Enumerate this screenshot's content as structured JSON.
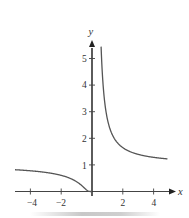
{
  "chart_data": {
    "type": "line",
    "title": "",
    "function": "y = e^(1/x)",
    "xlabel": "x",
    "ylabel": "y",
    "xlim": [
      -5,
      5
    ],
    "ylim": [
      0,
      5.5
    ],
    "grid": false,
    "legend": null,
    "x_ticks": [
      -4,
      -2,
      2,
      4
    ],
    "x_tick_labels": [
      "−4",
      "−2",
      "2",
      "4"
    ],
    "y_ticks": [
      1,
      2,
      3,
      4,
      5
    ],
    "y_tick_labels": [
      "1",
      "2",
      "3",
      "4",
      "5"
    ],
    "series": [
      {
        "name": "left branch (x < 0)",
        "x": [
          -5,
          -4,
          -3,
          -2,
          -1.5,
          -1,
          -0.5,
          -0.25,
          0
        ],
        "y": [
          0.82,
          0.78,
          0.72,
          0.61,
          0.51,
          0.37,
          0.14,
          0.02,
          0
        ]
      },
      {
        "name": "right branch (x > 0)",
        "x": [
          0.59,
          0.75,
          1,
          1.5,
          2,
          3,
          4,
          4.9
        ],
        "y": [
          5.5,
          3.79,
          2.72,
          1.95,
          1.65,
          1.4,
          1.28,
          1.23
        ]
      }
    ],
    "colors": {
      "axis": "#3a3a3a",
      "curve": "#555555",
      "text": "#333333"
    }
  }
}
